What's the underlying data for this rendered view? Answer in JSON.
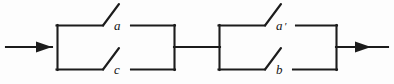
{
  "figure": {
    "kind": "switching-circuit-diagram",
    "background_color": "#fdfdfd",
    "line_color": "#1c1c1c"
  },
  "blocks": [
    {
      "id": "left-parallel-block",
      "position": "left",
      "switches": [
        {
          "id": "switch-a",
          "label": "a",
          "primed": false,
          "branch": "top"
        },
        {
          "id": "switch-c",
          "label": "c",
          "primed": false,
          "branch": "bottom"
        }
      ]
    },
    {
      "id": "right-parallel-block",
      "position": "right",
      "switches": [
        {
          "id": "switch-a-prime",
          "label": "a",
          "primed": true,
          "prime": "′",
          "branch": "top"
        },
        {
          "id": "switch-b",
          "label": "b",
          "primed": false,
          "branch": "bottom"
        }
      ]
    }
  ],
  "terminals": {
    "input_arrow": "input-terminal-arrow",
    "output_arrow": "output-terminal-arrow",
    "link": "series-link"
  },
  "labels": {
    "top_left": "a",
    "bottom_left": "c",
    "top_right": "a",
    "top_right_prime": "′",
    "bottom_right": "b"
  }
}
